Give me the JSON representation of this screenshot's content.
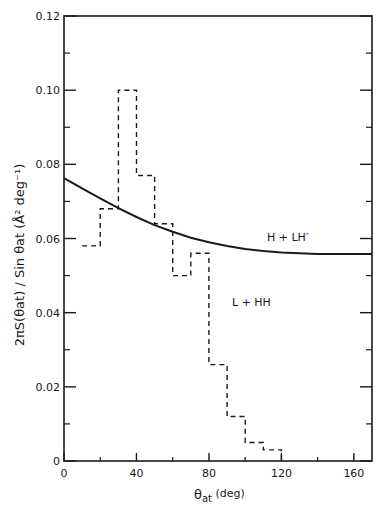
{
  "chart_data": {
    "type": "line",
    "title": "",
    "xlabel": "θat (deg)",
    "ylabel": "2πS(θat) / Sin θat (Å² deg⁻¹)",
    "xlim": [
      0,
      170
    ],
    "ylim": [
      0,
      0.12
    ],
    "grid": false,
    "legend": "inline labels",
    "x_ticks": [
      0,
      40,
      80,
      120,
      160
    ],
    "x_tick_labels": [
      "0",
      "40",
      "80",
      "120",
      "160"
    ],
    "x_minor_ticks": [
      20,
      60,
      100,
      140
    ],
    "y_ticks": [
      0,
      0.02,
      0.04,
      0.06,
      0.08,
      0.1,
      0.12
    ],
    "y_tick_labels": [
      "0",
      "0.02",
      "0.04",
      "0.06",
      "0.08",
      "0.10",
      "0.12"
    ],
    "y_minor_ticks": [
      0.01,
      0.03,
      0.05,
      0.07,
      0.09,
      0.11
    ],
    "series": [
      {
        "name": "H + LH′",
        "style": "solid line",
        "x": [
          0,
          10,
          20,
          30,
          40,
          50,
          60,
          70,
          80,
          90,
          100,
          110,
          120,
          130,
          140,
          150,
          160,
          170
        ],
        "values": [
          0.0763,
          0.0735,
          0.0708,
          0.0682,
          0.0658,
          0.0636,
          0.0618,
          0.0602,
          0.059,
          0.058,
          0.0572,
          0.0566,
          0.0562,
          0.056,
          0.0558,
          0.0558,
          0.0558,
          0.0558
        ]
      },
      {
        "name": "L + HH",
        "style": "dashed histogram",
        "bin_edges": [
          10,
          20,
          30,
          40,
          50,
          60,
          70,
          80,
          90,
          100,
          110,
          120
        ],
        "values": [
          0.058,
          0.068,
          0.1,
          0.077,
          0.064,
          0.05,
          0.056,
          0.026,
          0.012,
          0.005,
          0.003
        ]
      }
    ],
    "annotations": [
      {
        "text": "H + LH′",
        "x": 118,
        "y": 0.061
      },
      {
        "text": "L + HH",
        "x": 98,
        "y": 0.044
      }
    ]
  },
  "labels": {
    "series_a": "H + LH′",
    "series_b": "L + HH",
    "xlabel_main": "θ",
    "xlabel_sub": "at",
    "xlabel_unit": " (deg)",
    "ylabel_full": "2πS(θat) / Sin θat (Å² deg⁻¹)"
  }
}
